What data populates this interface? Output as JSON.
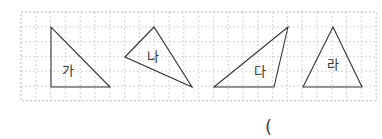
{
  "grid": {
    "x": 21,
    "y": 12,
    "cols": 24,
    "rows": 6,
    "cell": 14.8,
    "line_color": "#c8c8c8",
    "border_color": "#b0b0b0"
  },
  "triangles": [
    {
      "label": "가",
      "points": "51,27 51,87 110,87",
      "label_pos": [
        62,
        75
      ]
    },
    {
      "label": "나",
      "points": "125,57 154,27 192,87",
      "label_pos": [
        147,
        61
      ]
    },
    {
      "label": "다",
      "points": "214,87 288,27 274,87",
      "label_pos": [
        254,
        76
      ]
    },
    {
      "label": "라",
      "points": "303,87 333,27 362,87",
      "label_pos": [
        327,
        69
      ]
    }
  ],
  "answer": {
    "paren": "("
  }
}
